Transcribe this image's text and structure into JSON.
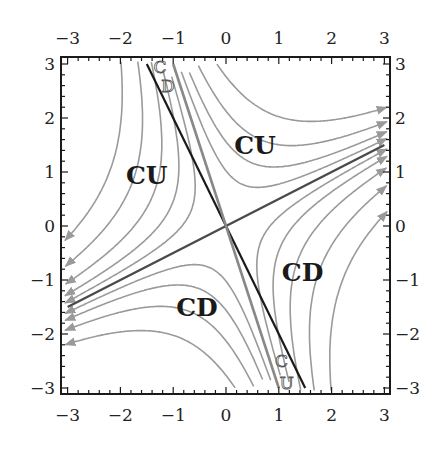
{
  "chart_data": {
    "type": "line",
    "subtype": "phase-portrait",
    "title": "",
    "xlabel": "",
    "ylabel": "",
    "xlim": [
      -3,
      3
    ],
    "ylim": [
      -3,
      3
    ],
    "grid": false,
    "frame": "box with ticks on all four sides",
    "x_ticks": [
      -3,
      -2,
      -1,
      0,
      1,
      2,
      3
    ],
    "y_ticks": [
      -3,
      -2,
      -1,
      0,
      1,
      2,
      3
    ],
    "x_tick_labels_top": [
      "−3",
      "−2",
      "−1",
      "0",
      "1",
      "2",
      "3"
    ],
    "x_tick_labels_bottom": [
      "−3",
      "−2",
      "−1",
      "0",
      "1",
      "2",
      "3"
    ],
    "y_tick_labels_left": [
      "3",
      "2",
      "1",
      "0",
      "−1",
      "−2",
      "−3"
    ],
    "y_tick_labels_right": [
      "3",
      "2",
      "1",
      "0",
      "−1",
      "−2",
      "−3"
    ],
    "straight_lines": [
      {
        "name": "unstable-separatrix",
        "slope": 0.5,
        "from": [
          -3,
          -1.5
        ],
        "to": [
          3,
          1.5
        ],
        "color": "#4a4a4a",
        "width": 2.4
      },
      {
        "name": "inflection-line",
        "slope": -2,
        "from": [
          -1.5,
          3
        ],
        "to": [
          1.5,
          -3
        ],
        "color": "#1a1a1a",
        "width": 2.2
      },
      {
        "name": "stable-separatrix",
        "slope": -3,
        "from": [
          -1,
          3
        ],
        "to": [
          1,
          -3
        ],
        "color": "#888888",
        "width": 2.6
      }
    ],
    "flow_curves": {
      "description": "saddle trajectories u*w=c in eigen-coordinates; u along (2,1) outgoing, w along (1,-3)",
      "color": "#9a9a9a",
      "constants": [
        -2.2,
        -1.3,
        -0.7,
        -0.3,
        0.3,
        0.7,
        1.3,
        2.2,
        3.4
      ]
    },
    "region_labels": [
      {
        "text": "CU",
        "x": -1.5,
        "y": 0.95
      },
      {
        "text": "CU",
        "x": 0.55,
        "y": 1.5
      },
      {
        "text": "CD",
        "x": 1.45,
        "y": -0.85
      },
      {
        "text": "CD",
        "x": -0.55,
        "y": -1.5
      }
    ],
    "annotations": [
      {
        "text": "C",
        "x": -1.25,
        "y": 2.95,
        "note": "stacked C over D near top, between lines"
      },
      {
        "text": "D",
        "x": -1.1,
        "y": 2.6
      },
      {
        "text": "C",
        "x": 1.05,
        "y": -2.5,
        "note": "stacked C over U near bottom, between lines"
      },
      {
        "text": "U",
        "x": 1.15,
        "y": -2.9
      }
    ]
  }
}
